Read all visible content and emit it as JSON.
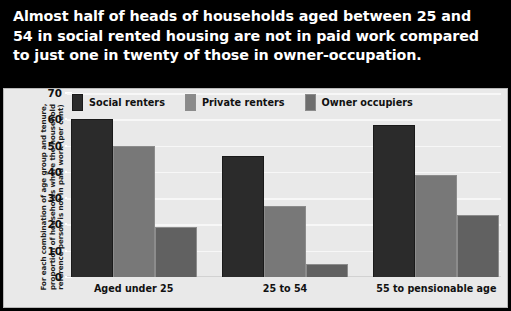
{
  "title": "Almost half of heads of households aged between 25 and 54 in social rented housing are not in paid work compared to just one in twenty of those in owner-occupation.",
  "chart_data": {
    "type": "bar",
    "title": "",
    "xlabel": "",
    "ylabel": "For each combination of age group and tenure, proportion of households where the household reference person is not in paid work (per cent)",
    "categories": [
      "Aged under 25",
      "25 to 54",
      "55 to pensionable age"
    ],
    "series": [
      {
        "name": "Social renters",
        "color": "#2b2b2b",
        "values": [
          60,
          46,
          58
        ]
      },
      {
        "name": "Private renters",
        "color": "#787878",
        "values": [
          50,
          27,
          39
        ]
      },
      {
        "name": "Owner occupiers",
        "color": "#616161",
        "values": [
          19,
          5,
          23.5
        ]
      }
    ],
    "ylim": [
      0,
      70
    ],
    "yticks": [
      0,
      10,
      20,
      30,
      40,
      50,
      60,
      70
    ],
    "ytick_labels": [
      "0",
      "10",
      "20",
      "30",
      "40",
      "50",
      "60",
      "70"
    ],
    "grid": true,
    "legend_position": "top-left",
    "background": "#e9e9e9",
    "banner_background": "#000000",
    "banner_text_color": "#ffffff"
  }
}
